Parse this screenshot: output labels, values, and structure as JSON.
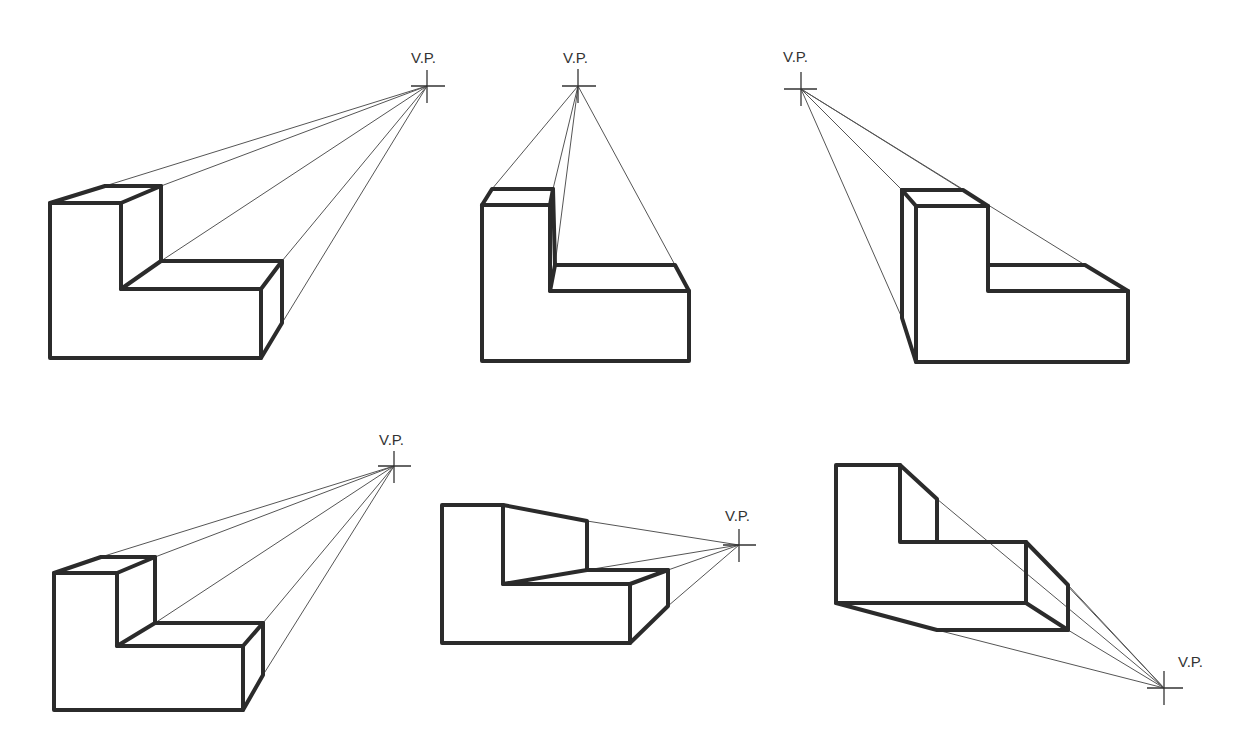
{
  "diagram": {
    "vp_label": "V.P.",
    "figures": [
      {
        "id": "fig-1",
        "position": "top-left",
        "vp": {
          "x": 427,
          "y": 86
        },
        "label": "V.P."
      },
      {
        "id": "fig-2",
        "position": "top-center",
        "vp": {
          "x": 578,
          "y": 86
        },
        "label": "V.P."
      },
      {
        "id": "fig-3",
        "position": "top-right",
        "vp": {
          "x": 801,
          "y": 89
        },
        "label": "V.P."
      },
      {
        "id": "fig-4",
        "position": "bottom-left",
        "vp": {
          "x": 394,
          "y": 466
        },
        "label": "V.P."
      },
      {
        "id": "fig-5",
        "position": "bottom-center",
        "vp": {
          "x": 739,
          "y": 545
        },
        "label": "V.P."
      },
      {
        "id": "fig-6",
        "position": "bottom-right",
        "vp": {
          "x": 1164,
          "y": 688
        },
        "label": "V.P."
      }
    ]
  }
}
